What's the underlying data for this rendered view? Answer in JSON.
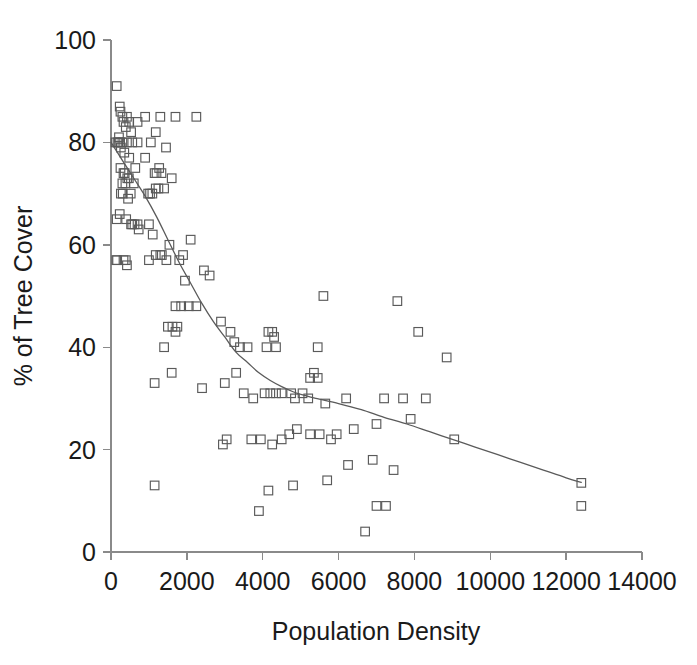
{
  "chart_data": {
    "type": "scatter",
    "title": "",
    "xlabel": "Population Density",
    "ylabel": "% of Tree Cover",
    "xlim": [
      0,
      14000
    ],
    "ylim": [
      0,
      100
    ],
    "grid": false,
    "legend": null,
    "xticks": [
      0,
      2000,
      4000,
      6000,
      8000,
      10000,
      12000,
      14000
    ],
    "xtick_labels": [
      "0",
      "2000",
      "4000",
      "6000",
      "8000",
      "10000",
      "12000",
      "14000"
    ],
    "yticks": [
      0,
      20,
      40,
      60,
      80,
      100
    ],
    "ytick_labels": [
      "0",
      "20",
      "40",
      "60",
      "80",
      "100"
    ],
    "marker": "open-square",
    "marker_color": "#5a5a5a",
    "series": [
      {
        "name": "Tree cover vs population density",
        "points": [
          [
            150,
            91
          ],
          [
            230,
            87
          ],
          [
            250,
            86
          ],
          [
            300,
            85
          ],
          [
            330,
            84
          ],
          [
            420,
            85
          ],
          [
            390,
            83
          ],
          [
            480,
            84
          ],
          [
            530,
            82
          ],
          [
            700,
            84
          ],
          [
            900,
            85
          ],
          [
            1300,
            85
          ],
          [
            1180,
            82
          ],
          [
            1700,
            85
          ],
          [
            2250,
            85
          ],
          [
            120,
            80
          ],
          [
            170,
            80
          ],
          [
            200,
            80
          ],
          [
            240,
            80
          ],
          [
            210,
            81
          ],
          [
            260,
            79
          ],
          [
            300,
            80
          ],
          [
            420,
            80
          ],
          [
            560,
            80
          ],
          [
            700,
            80
          ],
          [
            350,
            78
          ],
          [
            480,
            77
          ],
          [
            900,
            77
          ],
          [
            1050,
            80
          ],
          [
            1450,
            79
          ],
          [
            250,
            75
          ],
          [
            330,
            74
          ],
          [
            360,
            74
          ],
          [
            430,
            73
          ],
          [
            470,
            73
          ],
          [
            380,
            72
          ],
          [
            300,
            72
          ],
          [
            600,
            72
          ],
          [
            640,
            75
          ],
          [
            1150,
            74
          ],
          [
            1200,
            74
          ],
          [
            1270,
            75
          ],
          [
            1330,
            74
          ],
          [
            1180,
            71
          ],
          [
            1250,
            71
          ],
          [
            1400,
            71
          ],
          [
            1600,
            73
          ],
          [
            260,
            70
          ],
          [
            310,
            70
          ],
          [
            450,
            69
          ],
          [
            520,
            70
          ],
          [
            980,
            70
          ],
          [
            1030,
            70
          ],
          [
            1090,
            70
          ],
          [
            150,
            65
          ],
          [
            230,
            66
          ],
          [
            400,
            65
          ],
          [
            530,
            64
          ],
          [
            560,
            64
          ],
          [
            620,
            64
          ],
          [
            700,
            64
          ],
          [
            730,
            63
          ],
          [
            1000,
            64
          ],
          [
            1100,
            62
          ],
          [
            140,
            57
          ],
          [
            160,
            57
          ],
          [
            330,
            57
          ],
          [
            390,
            57
          ],
          [
            420,
            56
          ],
          [
            1000,
            57
          ],
          [
            1180,
            58
          ],
          [
            1300,
            58
          ],
          [
            1340,
            58
          ],
          [
            1460,
            57
          ],
          [
            1800,
            57
          ],
          [
            1900,
            58
          ],
          [
            1540,
            60
          ],
          [
            2100,
            61
          ],
          [
            2450,
            55
          ],
          [
            1950,
            53
          ],
          [
            2600,
            54
          ],
          [
            1700,
            48
          ],
          [
            1850,
            48
          ],
          [
            2050,
            48
          ],
          [
            2250,
            48
          ],
          [
            1500,
            44
          ],
          [
            1620,
            44
          ],
          [
            1700,
            43
          ],
          [
            1750,
            44
          ],
          [
            1400,
            40
          ],
          [
            2900,
            45
          ],
          [
            3150,
            43
          ],
          [
            3250,
            41
          ],
          [
            3400,
            40
          ],
          [
            3600,
            40
          ],
          [
            4150,
            43
          ],
          [
            4250,
            43
          ],
          [
            4300,
            42
          ],
          [
            4100,
            40
          ],
          [
            4350,
            40
          ],
          [
            5450,
            40
          ],
          [
            5600,
            50
          ],
          [
            7550,
            49
          ],
          [
            8100,
            43
          ],
          [
            8850,
            38
          ],
          [
            1150,
            33
          ],
          [
            1600,
            35
          ],
          [
            2400,
            32
          ],
          [
            3000,
            33
          ],
          [
            3300,
            35
          ],
          [
            3500,
            31
          ],
          [
            3750,
            30
          ],
          [
            4050,
            31
          ],
          [
            4200,
            31
          ],
          [
            4350,
            31
          ],
          [
            4500,
            31
          ],
          [
            4750,
            31
          ],
          [
            4850,
            30
          ],
          [
            5050,
            31
          ],
          [
            5250,
            34
          ],
          [
            5350,
            35
          ],
          [
            5450,
            34
          ],
          [
            5200,
            30
          ],
          [
            5650,
            29
          ],
          [
            6200,
            30
          ],
          [
            7200,
            30
          ],
          [
            7700,
            30
          ],
          [
            8300,
            30
          ],
          [
            7900,
            26
          ],
          [
            7000,
            25
          ],
          [
            6400,
            24
          ],
          [
            5950,
            23
          ],
          [
            5800,
            22
          ],
          [
            5500,
            23
          ],
          [
            5250,
            23
          ],
          [
            4900,
            24
          ],
          [
            4700,
            23
          ],
          [
            4500,
            22
          ],
          [
            4250,
            21
          ],
          [
            3950,
            22
          ],
          [
            3700,
            22
          ],
          [
            3050,
            22
          ],
          [
            2950,
            21
          ],
          [
            9050,
            22
          ],
          [
            7450,
            16
          ],
          [
            6900,
            18
          ],
          [
            6250,
            17
          ],
          [
            5700,
            14
          ],
          [
            4800,
            13
          ],
          [
            4150,
            12
          ],
          [
            3900,
            8
          ],
          [
            7000,
            9
          ],
          [
            7250,
            9
          ],
          [
            6700,
            4
          ],
          [
            1150,
            13
          ],
          [
            12400,
            13.5
          ],
          [
            12400,
            9
          ]
        ]
      }
    ],
    "trendline": {
      "name": "fitted curve",
      "color": "#5a5a5a",
      "points": [
        [
          0,
          80
        ],
        [
          300,
          76.5
        ],
        [
          600,
          73
        ],
        [
          900,
          69.5
        ],
        [
          1200,
          65.5
        ],
        [
          1500,
          61
        ],
        [
          1800,
          56.5
        ],
        [
          2100,
          52.5
        ],
        [
          2400,
          48.5
        ],
        [
          2700,
          45
        ],
        [
          3000,
          42
        ],
        [
          3300,
          39
        ],
        [
          3600,
          37
        ],
        [
          3900,
          35
        ],
        [
          4200,
          33.5
        ],
        [
          4500,
          32.3
        ],
        [
          4800,
          31.3
        ],
        [
          5100,
          30.6
        ],
        [
          5400,
          30
        ],
        [
          6000,
          29
        ],
        [
          6600,
          27.8
        ],
        [
          7200,
          26.3
        ],
        [
          7800,
          25
        ],
        [
          8400,
          23.5
        ],
        [
          9000,
          22
        ],
        [
          9600,
          20.5
        ],
        [
          10200,
          19
        ],
        [
          10800,
          17.5
        ],
        [
          11400,
          16
        ],
        [
          12000,
          14.5
        ],
        [
          12400,
          13.6
        ]
      ]
    }
  },
  "axis": {
    "x_title": "Population Density",
    "y_title": "% of Tree Cover"
  }
}
